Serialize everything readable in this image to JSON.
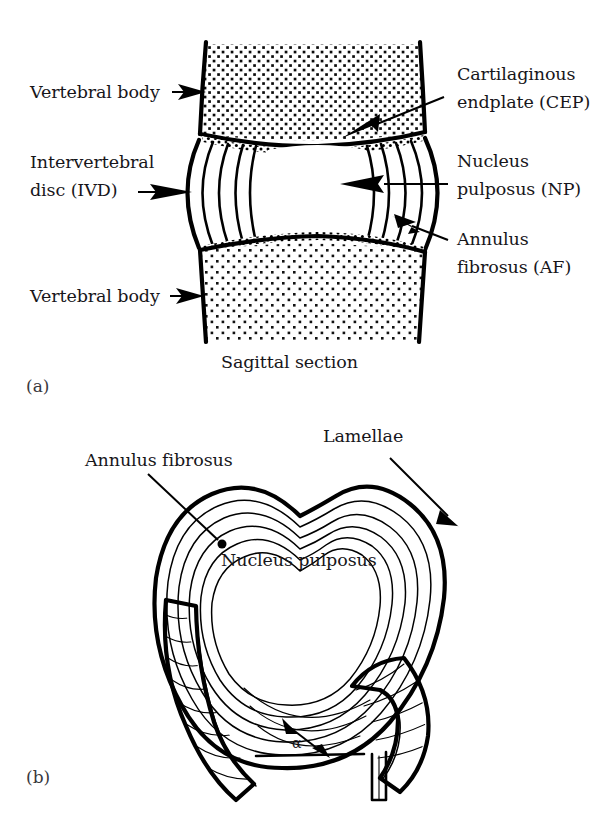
{
  "figure": {
    "ink_color": "#000000",
    "background_color": "#ffffff"
  },
  "panel_a": {
    "id": "(a)",
    "caption": "Sagittal section",
    "labels": {
      "vertebral_body_top": "Vertebral body",
      "intervertebral_disc_line1": "Intervertebral",
      "intervertebral_disc_line2": "disc (IVD)",
      "vertebral_body_bottom": "Vertebral body",
      "cartilaginous_endplate_line1": "Cartilaginous",
      "cartilaginous_endplate_line2": "endplate (CEP)",
      "nucleus_pulposus_line1": "Nucleus",
      "nucleus_pulposus_line2": "pulposus (NP)",
      "annulus_fibrosus_line1": "Annulus",
      "annulus_fibrosus_line2": "fibrosus (AF)"
    }
  },
  "panel_b": {
    "id": "(b)",
    "labels": {
      "annulus_fibrosus": "Annulus fibrosus",
      "lamellae": "Lamellae",
      "nucleus_pulposus": "Nucleus pulposus",
      "fiber_angle": "α"
    }
  }
}
